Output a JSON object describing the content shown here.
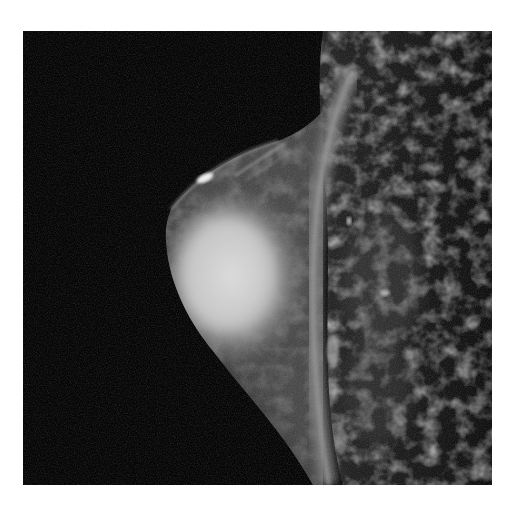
{
  "image": {
    "kind": "MRI",
    "view": "sagittal",
    "subject": "breast",
    "colors": {
      "page_background": "#ffffff",
      "scan_background": "#050505",
      "glandular_tissue": "#d8d8d8",
      "fat_tissue": "#6a6a6a",
      "chest_wall_band": "#8a8a8a",
      "highlight": "#f2f2f2"
    }
  }
}
